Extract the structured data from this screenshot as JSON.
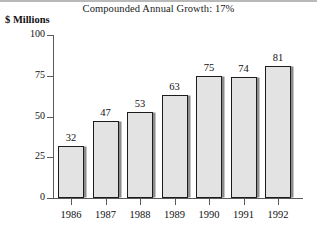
{
  "chart_data": {
    "type": "bar",
    "title": "Compounded Annual Growth: 17%",
    "ylabel": "$ Millions",
    "xlabel": "",
    "categories": [
      "1986",
      "1987",
      "1988",
      "1989",
      "1990",
      "1991",
      "1992"
    ],
    "values": [
      32,
      47,
      53,
      63,
      75,
      74,
      81
    ],
    "data_labels": [
      "32",
      "47",
      "53",
      "63",
      "75",
      "74",
      "81"
    ],
    "ylim": [
      0,
      100
    ],
    "yticks": [
      0,
      25,
      50,
      75,
      100
    ],
    "ytick_labels": [
      "0",
      "25",
      "50",
      "75",
      "100"
    ],
    "grid": false,
    "legend": false,
    "bar_fill_color": "#e3e3e3",
    "bar_border_color": "#1c1c1c",
    "bar_shadow_color": "#8c8c8c",
    "axis_color": "#5a5a5a",
    "background_color": "#ffffff",
    "text_color": "#111111"
  }
}
